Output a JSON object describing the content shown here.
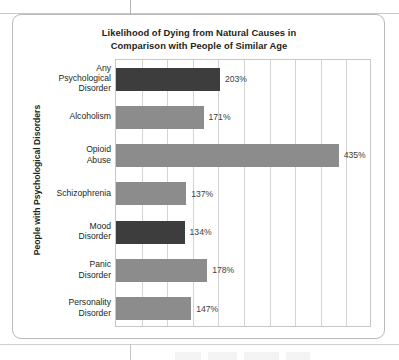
{
  "chart_data": {
    "type": "bar",
    "orientation": "horizontal",
    "title": "Likelihood of Dying from Natural Causes in Comparison with People of Similar Age",
    "title_line1": "Likelihood of Dying from Natural Causes in",
    "title_line2": "Comparison with People of Similar Age",
    "xlabel": "",
    "ylabel": "People with Psychological Disorders",
    "xlim": [
      0,
      500
    ],
    "grid": true,
    "gridline_interval": 50,
    "legend": "none",
    "value_suffix": "%",
    "categories": [
      "Any Psychological Disorder",
      "Alcoholism",
      "Opioid Abuse",
      "Schizophrenia",
      "Mood Disorder",
      "Panic Disorder",
      "Personality Disorder"
    ],
    "category_lines": [
      [
        "Any",
        "Psychological",
        "Disorder"
      ],
      [
        "Alcoholism"
      ],
      [
        "Opioid",
        "Abuse"
      ],
      [
        "Schizophrenia"
      ],
      [
        "Mood",
        "Disorder"
      ],
      [
        "Panic",
        "Disorder"
      ],
      [
        "Personality",
        "Disorder"
      ]
    ],
    "values": [
      203,
      171,
      435,
      137,
      134,
      178,
      147
    ],
    "value_labels": [
      "203%",
      "171%",
      "435%",
      "137%",
      "134%",
      "178%",
      "147%"
    ],
    "bar_colors": [
      "#3d3d3d",
      "#8c8c8c",
      "#8c8c8c",
      "#8c8c8c",
      "#3d3d3d",
      "#8c8c8c",
      "#8c8c8c"
    ],
    "colors": {
      "bar_dark": "#3d3d3d",
      "bar_gray": "#8c8c8c",
      "gridline": "#d4d4d4",
      "plot_border": "#c6c6c6",
      "figure_border": "#b9b9b9",
      "text": "#231f20",
      "value_text": "#3c3c3c"
    }
  }
}
